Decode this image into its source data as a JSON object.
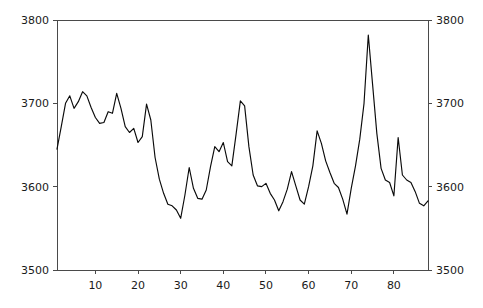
{
  "chart_data": {
    "type": "line",
    "title": "",
    "subtitle": "",
    "xlabel": "",
    "ylabel": "",
    "xlim": [
      1,
      88
    ],
    "ylim": [
      3500,
      3800
    ],
    "grid": false,
    "legend": null,
    "legend_position": "none",
    "axes": {
      "left": {
        "ticks": [
          3500,
          3600,
          3700,
          3800
        ],
        "tick_labels": [
          "3500",
          "3600",
          "3700",
          "3800"
        ]
      },
      "right": {
        "ticks": [
          3500,
          3600,
          3700,
          3800
        ],
        "tick_labels": [
          "3500",
          "3600",
          "3700",
          "3800"
        ]
      },
      "bottom": {
        "ticks": [
          10,
          20,
          30,
          40,
          50,
          60,
          70,
          80
        ],
        "tick_labels": [
          "10",
          "20",
          "30",
          "40",
          "50",
          "60",
          "70",
          "80"
        ]
      }
    },
    "line_color": "#0a0a0a",
    "axis_color": "#4a4a4a",
    "x": [
      1,
      2,
      3,
      4,
      5,
      6,
      7,
      8,
      9,
      10,
      11,
      12,
      13,
      14,
      15,
      16,
      17,
      18,
      19,
      20,
      21,
      22,
      23,
      24,
      25,
      26,
      27,
      28,
      29,
      30,
      31,
      32,
      33,
      34,
      35,
      36,
      37,
      38,
      39,
      40,
      41,
      42,
      43,
      44,
      45,
      46,
      47,
      48,
      49,
      50,
      51,
      52,
      53,
      54,
      55,
      56,
      57,
      58,
      59,
      60,
      61,
      62,
      63,
      64,
      65,
      66,
      67,
      68,
      69,
      70,
      71,
      72,
      73,
      74,
      75,
      76,
      77,
      78,
      79,
      80,
      81,
      82,
      83,
      84,
      85,
      86,
      87,
      88
    ],
    "values": [
      3645,
      3672,
      3700,
      3709,
      3694,
      3702,
      3714,
      3709,
      3695,
      3683,
      3676,
      3677,
      3690,
      3688,
      3712,
      3694,
      3672,
      3665,
      3670,
      3653,
      3660,
      3699,
      3680,
      3635,
      3609,
      3592,
      3579,
      3577,
      3572,
      3562,
      3590,
      3623,
      3598,
      3586,
      3585,
      3596,
      3624,
      3648,
      3642,
      3653,
      3630,
      3625,
      3663,
      3703,
      3697,
      3648,
      3614,
      3601,
      3600,
      3604,
      3592,
      3584,
      3571,
      3582,
      3597,
      3618,
      3601,
      3584,
      3579,
      3600,
      3625,
      3667,
      3652,
      3631,
      3617,
      3604,
      3599,
      3585,
      3567,
      3598,
      3625,
      3657,
      3700,
      3782,
      3723,
      3664,
      3622,
      3608,
      3605,
      3589,
      3659,
      3614,
      3608,
      3605,
      3594,
      3580,
      3577,
      3583
    ],
    "series": [
      {
        "name": "series-1",
        "values": [
          3645,
          3672,
          3700,
          3709,
          3694,
          3702,
          3714,
          3709,
          3695,
          3683,
          3676,
          3677,
          3690,
          3688,
          3712,
          3694,
          3672,
          3665,
          3670,
          3653,
          3660,
          3699,
          3680,
          3635,
          3609,
          3592,
          3579,
          3577,
          3572,
          3562,
          3590,
          3623,
          3598,
          3586,
          3585,
          3596,
          3624,
          3648,
          3642,
          3653,
          3630,
          3625,
          3663,
          3703,
          3697,
          3648,
          3614,
          3601,
          3600,
          3604,
          3592,
          3584,
          3571,
          3582,
          3597,
          3618,
          3601,
          3584,
          3579,
          3600,
          3625,
          3667,
          3652,
          3631,
          3617,
          3604,
          3599,
          3585,
          3567,
          3598,
          3625,
          3657,
          3700,
          3782,
          3723,
          3664,
          3622,
          3608,
          3605,
          3589,
          3659,
          3614,
          3608,
          3605,
          3594,
          3580,
          3577,
          3583
        ]
      }
    ]
  },
  "plot_geometry": {
    "left": 57,
    "right": 428,
    "top": 20,
    "bottom": 270
  }
}
